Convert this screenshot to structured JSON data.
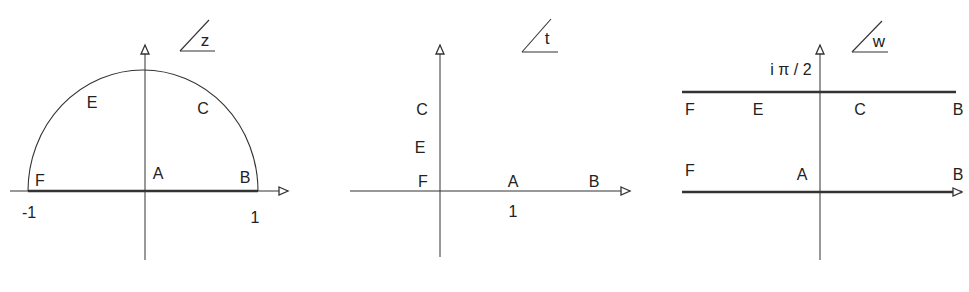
{
  "diagram": {
    "type": "conformal-mapping",
    "stroke_color": "#333333",
    "panels": [
      {
        "id": "z-plane",
        "plane_label": "z",
        "region": "upper half unit disk",
        "boundary_points": [
          {
            "name": "F",
            "x": 40,
            "y": 181
          },
          {
            "name": "E",
            "x": 92,
            "y": 103
          },
          {
            "name": "A",
            "x": 158,
            "y": 174
          },
          {
            "name": "C",
            "x": 203,
            "y": 109
          },
          {
            "name": "B",
            "x": 245,
            "y": 178
          }
        ],
        "ticks": [
          {
            "text": "-1",
            "x": 29,
            "y": 213
          },
          {
            "text": "1",
            "x": 255,
            "y": 218
          }
        ]
      },
      {
        "id": "t-plane",
        "plane_label": "t",
        "region": "first quadrant",
        "boundary_points": [
          {
            "name": "C",
            "x": 422,
            "y": 110
          },
          {
            "name": "E",
            "x": 420,
            "y": 148
          },
          {
            "name": "F",
            "x": 423,
            "y": 182
          },
          {
            "name": "A",
            "x": 513,
            "y": 182
          },
          {
            "name": "B",
            "x": 594,
            "y": 182
          }
        ],
        "ticks": [
          {
            "text": "1",
            "x": 513,
            "y": 212
          }
        ]
      },
      {
        "id": "w-plane",
        "plane_label": "w",
        "region": "strip 0 < Im w < π/2",
        "boundary_points": [
          {
            "name": "F",
            "x": 690,
            "y": 110
          },
          {
            "name": "E",
            "x": 758,
            "y": 110
          },
          {
            "name": "C",
            "x": 860,
            "y": 110
          },
          {
            "name": "B",
            "x": 958,
            "y": 110
          },
          {
            "name": "F",
            "x": 690,
            "y": 171
          },
          {
            "name": "A",
            "x": 802,
            "y": 175
          },
          {
            "name": "B",
            "x": 958,
            "y": 175
          }
        ],
        "ticks": [
          {
            "text": "i π / 2",
            "x": 791,
            "y": 70
          }
        ]
      }
    ]
  }
}
